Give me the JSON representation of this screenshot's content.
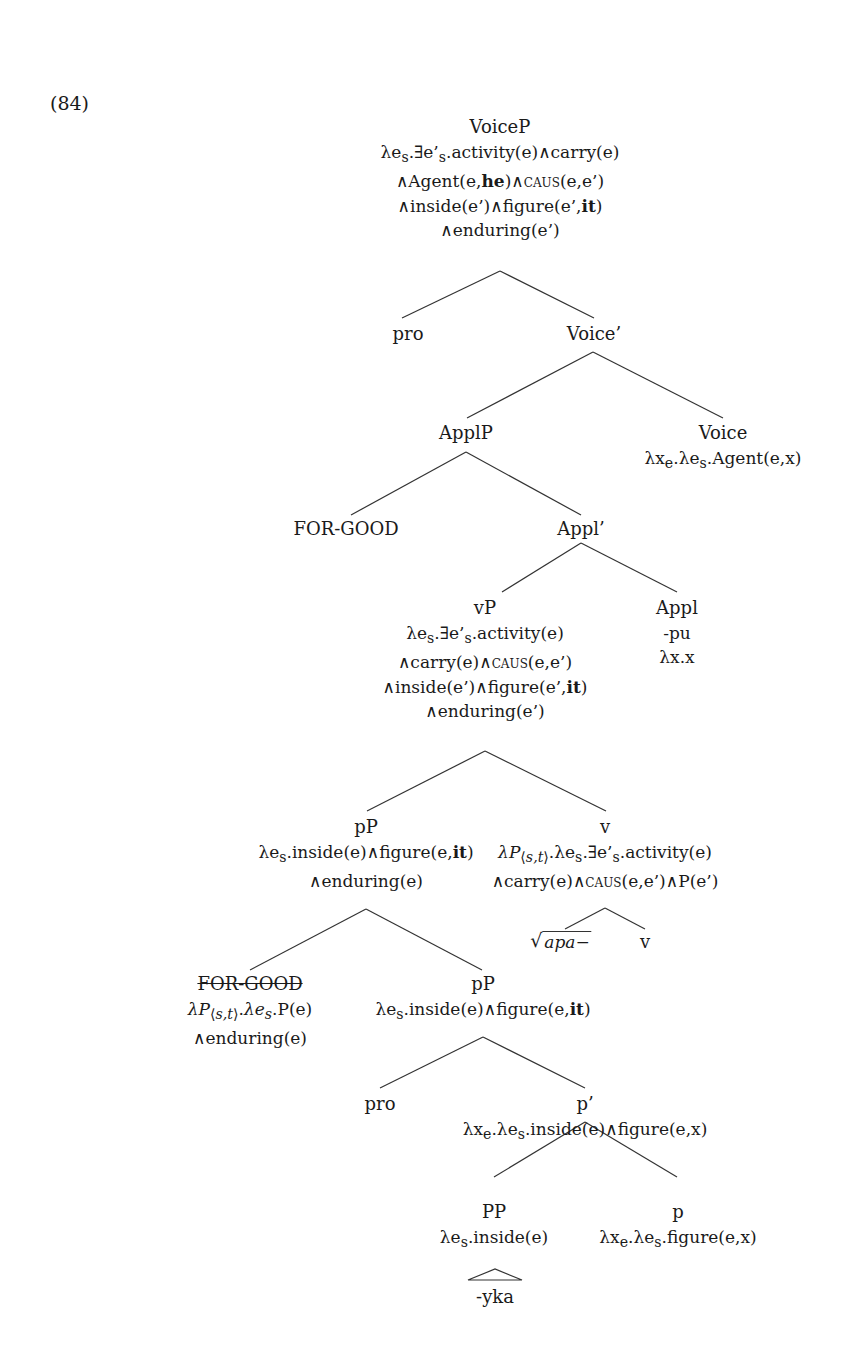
{
  "example_number": "(84)",
  "tree": {
    "VoiceP": {
      "label": "VoiceP",
      "sem": [
        "λeₛ.∃e’ₛ.activity(e)∧carry(e)",
        "∧Agent(e,he)∧CAUS(e,e’)",
        "∧inside(e’)∧figure(e’,it)",
        "∧enduring(e’)"
      ]
    },
    "pro_1": {
      "label": "pro"
    },
    "Voice_bar": {
      "label": "Voice’"
    },
    "ApplP": {
      "label": "ApplP"
    },
    "Voice": {
      "label": "Voice",
      "sem": [
        "λxₑ.λeₛ.Agent(e,x)"
      ]
    },
    "FOR_GOOD_1": {
      "label": "FOR-GOOD"
    },
    "Appl_bar": {
      "label": "Appl’"
    },
    "vP": {
      "label": "vP",
      "sem": [
        "λeₛ.∃e’ₛ.activity(e)",
        "∧carry(e)∧CAUS(e,e’)",
        "∧inside(e’)∧figure(e’,it)",
        "∧enduring(e’)"
      ]
    },
    "Appl": {
      "label": "Appl",
      "sem": [
        "-pu",
        "λx.x"
      ]
    },
    "pP_1": {
      "label": "pP",
      "sem": [
        "λeₛ.inside(e)∧figure(e,it)",
        "∧enduring(e)"
      ]
    },
    "v_1": {
      "label": "v",
      "sem": [
        "λP⟨s,t⟩.λeₛ.∃e’ₛ.activity(e)",
        "∧carry(e)∧CAUS(e,e’)∧P(e’)"
      ]
    },
    "root": {
      "label": "apa−"
    },
    "v_2": {
      "label": "v"
    },
    "FOR_GOOD_2": {
      "label": "FOR-GOOD",
      "struck": true,
      "sem": [
        "λP⟨s,t⟩.λeₛ.P(e)",
        "∧enduring(e)"
      ]
    },
    "pP_2": {
      "label": "pP",
      "sem": [
        "λeₛ.inside(e)∧figure(e,it)"
      ]
    },
    "pro_2": {
      "label": "pro"
    },
    "p_bar": {
      "label": "p’",
      "sem": [
        "λxₑ.λeₛ.inside(e)∧figure(e,x)"
      ]
    },
    "PP": {
      "label": "PP",
      "sem": [
        "λeₛ.inside(e)"
      ]
    },
    "p": {
      "label": "p",
      "sem": [
        "λxₑ.λeₛ.figure(e,x)"
      ]
    },
    "yka": {
      "label": "-yka"
    }
  }
}
